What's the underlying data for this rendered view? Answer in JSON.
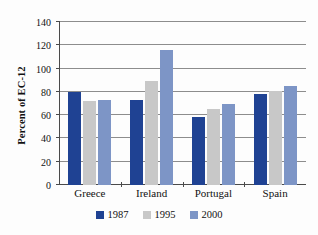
{
  "chart_data": {
    "type": "bar",
    "title": "",
    "subtitle": "",
    "xlabel": "",
    "ylabel": "Percent of EC-12",
    "ylim": [
      0,
      140
    ],
    "yticks": [
      0,
      20,
      40,
      60,
      80,
      100,
      120,
      140
    ],
    "ytick_labels": [
      "0",
      "20",
      "40",
      "60",
      "80",
      "100",
      "120",
      "140"
    ],
    "grid": true,
    "legend_position": "bottom",
    "categories": [
      "Greece",
      "Ireland",
      "Portugal",
      "Spain"
    ],
    "series": [
      {
        "name": "1987",
        "color": "#1f4293",
        "values": [
          80,
          73,
          58,
          78
        ]
      },
      {
        "name": "1995",
        "color": "#c8c8c8",
        "values": [
          72,
          89,
          65,
          81
        ]
      },
      {
        "name": "2000",
        "color": "#7d95c6",
        "values": [
          73,
          116,
          70,
          85
        ]
      }
    ]
  },
  "colors": {
    "series_1987": "#1f4293",
    "series_1995": "#c8c8c8",
    "series_2000": "#7d95c6",
    "axis": "#4a4a4a",
    "gridline": "#8d8d8d",
    "background": "#fdfdfd"
  }
}
